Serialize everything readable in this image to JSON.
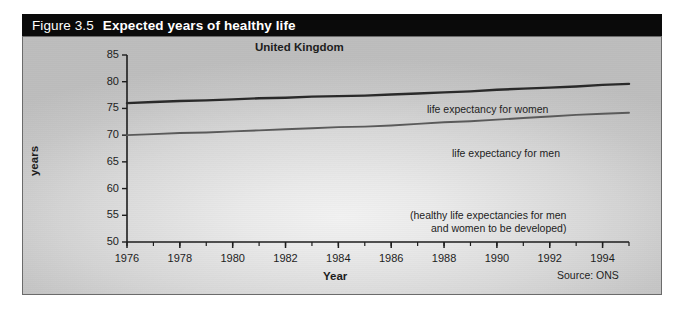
{
  "figure": {
    "number": "Figure 3.5",
    "title": "Expected years of healthy life"
  },
  "panel": {
    "region_label": "United Kingdom",
    "source": "Source: ONS",
    "note_line1": "(healthy life expectancies for men",
    "note_line2": "and women to be developed)"
  },
  "annotations": {
    "women": "life expectancy for women",
    "men": "life expectancy for men"
  },
  "colors": {
    "title_bar": "#0a0a0a",
    "title_text": "#ffffff",
    "panel_border": "#6b6b6b",
    "women_line": "#2a2a2a",
    "men_line": "#5a5a5a",
    "axis": "#1d1d1d"
  },
  "chart_data": {
    "type": "line",
    "title": "Expected years of healthy life",
    "subtitle": "United Kingdom",
    "xlabel": "Year",
    "ylabel": "years",
    "xlim": [
      1976,
      1995
    ],
    "ylim": [
      50,
      85
    ],
    "ytick_step": 5,
    "xtick_step": 2,
    "xtick_minor_step": 1,
    "grid": false,
    "legend": "inline-annotations",
    "yticks": [
      50,
      55,
      60,
      65,
      70,
      75,
      80,
      85
    ],
    "xticks": [
      1976,
      1978,
      1980,
      1982,
      1984,
      1986,
      1988,
      1990,
      1992,
      1994
    ],
    "x": [
      1976,
      1977,
      1978,
      1979,
      1980,
      1981,
      1982,
      1983,
      1984,
      1985,
      1986,
      1987,
      1988,
      1989,
      1990,
      1991,
      1992,
      1993,
      1994,
      1995
    ],
    "series": [
      {
        "name": "life expectancy for women",
        "values": [
          76.0,
          76.2,
          76.4,
          76.5,
          76.7,
          76.9,
          77.0,
          77.2,
          77.3,
          77.4,
          77.6,
          77.8,
          78.0,
          78.2,
          78.5,
          78.7,
          78.9,
          79.1,
          79.4,
          79.6
        ]
      },
      {
        "name": "life expectancy for men",
        "values": [
          70.0,
          70.2,
          70.4,
          70.5,
          70.7,
          70.9,
          71.1,
          71.3,
          71.5,
          71.6,
          71.8,
          72.1,
          72.4,
          72.6,
          72.9,
          73.2,
          73.5,
          73.8,
          74.0,
          74.2
        ]
      }
    ],
    "annotation": "(healthy life expectancies for men and women to be developed)",
    "source": "Source: ONS"
  }
}
